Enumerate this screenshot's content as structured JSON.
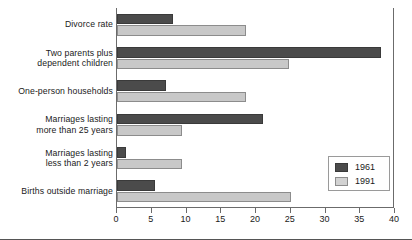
{
  "chart_data": {
    "type": "bar",
    "orientation": "horizontal",
    "title": "",
    "xlabel": "",
    "ylabel": "",
    "xlim": [
      0,
      40
    ],
    "xticks": [
      0,
      5,
      10,
      15,
      20,
      25,
      30,
      35,
      40
    ],
    "grid": false,
    "legend_position": "bottom-right",
    "categories": [
      "Divorce rate",
      "Two parents plus\ndependent children",
      "One-person households",
      "Marriages lasting\nmore than 25 years",
      "Marriages lasting\nless than 2 years",
      "Births outside marriage"
    ],
    "category_lines": [
      [
        "Divorce rate"
      ],
      [
        "Two parents plus",
        "dependent children"
      ],
      [
        "One-person households"
      ],
      [
        "Marriages lasting",
        "more than 25 years"
      ],
      [
        "Marriages lasting",
        "less than 2 years"
      ],
      [
        "Births outside marriage"
      ]
    ],
    "series": [
      {
        "name": "1961",
        "color": "#4b4b4b",
        "values": [
          8,
          38,
          7,
          21,
          1.3,
          5.4
        ]
      },
      {
        "name": "1991",
        "color": "#c8c8c8",
        "values": [
          18.5,
          24.7,
          18.5,
          9.3,
          9.3,
          25
        ]
      }
    ]
  },
  "legend": {
    "entries": [
      {
        "label": "1961",
        "swatch": "dark-swatch"
      },
      {
        "label": "1991",
        "swatch": "light-swatch"
      }
    ]
  },
  "axis": {
    "tick_labels": [
      "0",
      "5",
      "10",
      "15",
      "20",
      "25",
      "30",
      "35",
      "40"
    ]
  }
}
